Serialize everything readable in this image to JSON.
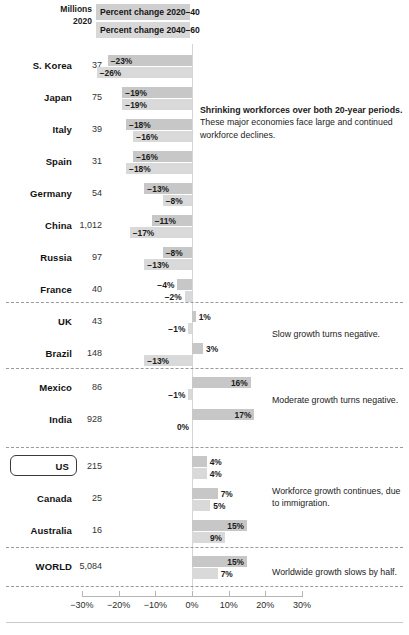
{
  "header": {
    "units_line1": "Millions",
    "units_line2": "2020",
    "band1": "Percent change 2020–40",
    "band2": "Percent change 2040–60"
  },
  "axis": {
    "ticks": [
      "−30%",
      "−20%",
      "−10%",
      "0%",
      "10%",
      "20%",
      "30%"
    ],
    "tick_values": [
      -30,
      -20,
      -10,
      0,
      10,
      20,
      30
    ],
    "min": -30,
    "max": 30
  },
  "annotations": {
    "group1_bold": "Shrinking workforces over both 20-year periods.",
    "group1_body": "These major economies face large and continued workforce declines.",
    "group2": "Slow growth turns negative.",
    "group3": "Moderate growth turns negative.",
    "group4": "Workforce growth continues, due to immigration.",
    "group5": "Worldwide growth slows by half."
  },
  "colors": {
    "bar_2020_40": "#c7c7c7",
    "bar_2040_60": "#d9d9d9",
    "header_band": "#cfcfcf",
    "separator": "#9a9a9a",
    "text": "#1b1b1b"
  },
  "chart_data": {
    "type": "bar",
    "title": "",
    "xlabel": "",
    "ylabel": "",
    "xlim": [
      -30,
      30
    ],
    "grid": false,
    "orientation": "horizontal",
    "series": [
      {
        "name": "Percent change 2020–40"
      },
      {
        "name": "Percent change 2040–60"
      }
    ],
    "categories": [
      "S. Korea",
      "Japan",
      "Italy",
      "Spain",
      "Germany",
      "China",
      "Russia",
      "France",
      "UK",
      "Brazil",
      "Mexico",
      "India",
      "US",
      "Canada",
      "Australia",
      "WORLD"
    ],
    "rows": [
      {
        "name": "S. Korea",
        "millions": "37",
        "v1": -23,
        "v2": -26,
        "l1": "−23%",
        "l2": "−26%",
        "group": 0
      },
      {
        "name": "Japan",
        "millions": "75",
        "v1": -19,
        "v2": -19,
        "l1": "−19%",
        "l2": "−19%",
        "group": 0
      },
      {
        "name": "Italy",
        "millions": "39",
        "v1": -18,
        "v2": -16,
        "l1": "−18%",
        "l2": "−16%",
        "group": 0
      },
      {
        "name": "Spain",
        "millions": "31",
        "v1": -16,
        "v2": -18,
        "l1": "−16%",
        "l2": "−18%",
        "group": 0
      },
      {
        "name": "Germany",
        "millions": "54",
        "v1": -13,
        "v2": -8,
        "l1": "−13%",
        "l2": "−8%",
        "group": 0
      },
      {
        "name": "China",
        "millions": "1,012",
        "v1": -11,
        "v2": -17,
        "l1": "−11%",
        "l2": "−17%",
        "group": 0
      },
      {
        "name": "Russia",
        "millions": "97",
        "v1": -8,
        "v2": -13,
        "l1": "−8%",
        "l2": "−13%",
        "group": 0
      },
      {
        "name": "France",
        "millions": "40",
        "v1": -4,
        "v2": -2,
        "l1": "−4%",
        "l2": "−2%",
        "group": 0
      },
      {
        "name": "UK",
        "millions": "43",
        "v1": 1,
        "v2": -1,
        "l1": "1%",
        "l2": "−1%",
        "group": 1
      },
      {
        "name": "Brazil",
        "millions": "148",
        "v1": 3,
        "v2": -13,
        "l1": "3%",
        "l2": "−13%",
        "group": 1
      },
      {
        "name": "Mexico",
        "millions": "86",
        "v1": 16,
        "v2": -1,
        "l1": "16%",
        "l2": "−1%",
        "group": 2
      },
      {
        "name": "India",
        "millions": "928",
        "v1": 17,
        "v2": 0,
        "l1": "17%",
        "l2": "0%",
        "group": 2
      },
      {
        "name": "US",
        "millions": "215",
        "v1": 4,
        "v2": 4,
        "l1": "4%",
        "l2": "4%",
        "group": 3,
        "highlight": true
      },
      {
        "name": "Canada",
        "millions": "25",
        "v1": 7,
        "v2": 5,
        "l1": "7%",
        "l2": "5%",
        "group": 3
      },
      {
        "name": "Australia",
        "millions": "16",
        "v1": 15,
        "v2": 9,
        "l1": "15%",
        "l2": "9%",
        "group": 3
      },
      {
        "name": "WORLD",
        "millions": "5,084",
        "v1": 15,
        "v2": 7,
        "l1": "15%",
        "l2": "7%",
        "group": 4
      }
    ]
  }
}
